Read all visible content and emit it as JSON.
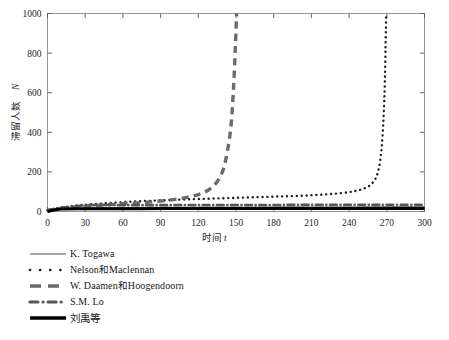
{
  "chart_data": {
    "type": "line",
    "title": "",
    "xlabel": "时间 t",
    "ylabel": "滞留人数 N",
    "xlabel_cjk": "时间",
    "xlabel_var": "t",
    "ylabel_cjk": "滞留人数",
    "ylabel_var": "N",
    "xlim": [
      0,
      300
    ],
    "ylim": [
      0,
      1000
    ],
    "xticks": [
      0,
      30,
      60,
      90,
      120,
      150,
      180,
      210,
      240,
      270,
      300
    ],
    "yticks": [
      0,
      200,
      400,
      600,
      800,
      1000
    ],
    "grid": false,
    "legend_position": "below-left",
    "series": [
      {
        "name": "K. Togawa",
        "style": "solid-thin",
        "color": "#4a4a4a",
        "width": 1.0,
        "x": [
          0,
          15,
          30,
          60,
          90,
          120,
          150,
          180,
          210,
          240,
          270,
          300
        ],
        "values": [
          0,
          14,
          18,
          20,
          21,
          22,
          22,
          23,
          23,
          23,
          24,
          24
        ]
      },
      {
        "name": "Nelson和Maclennan",
        "name_latin_1": "Nelson",
        "name_han": "和",
        "name_latin_2": "Maclennan",
        "style": "dotted",
        "color": "#1f1f1f",
        "width": 2.4,
        "x": [
          0,
          10,
          20,
          30,
          45,
          60,
          75,
          90,
          105,
          120,
          135,
          150,
          165,
          180,
          195,
          210,
          225,
          240,
          250,
          258,
          263,
          266,
          268,
          269,
          269.5
        ],
        "values": [
          6,
          20,
          28,
          34,
          41,
          47,
          52,
          56,
          60,
          63,
          66,
          69,
          72,
          75,
          78,
          82,
          88,
          98,
          112,
          140,
          200,
          330,
          560,
          830,
          1000
        ]
      },
      {
        "name": "W. Daamen和Hoogendoorn",
        "name_latin_1": "W. Daamen",
        "name_han": "和",
        "name_latin_2": "Hoogendoorn",
        "style": "dashed-thick",
        "color": "#6b6b6b",
        "width": 3.4,
        "x": [
          0,
          10,
          20,
          30,
          45,
          60,
          75,
          90,
          100,
          110,
          118,
          125,
          131,
          136,
          140,
          143,
          146,
          148,
          149.5,
          150.5
        ],
        "values": [
          4,
          15,
          22,
          27,
          33,
          39,
          45,
          53,
          60,
          70,
          82,
          98,
          122,
          160,
          215,
          300,
          430,
          620,
          830,
          1000
        ]
      },
      {
        "name": "S.M. Lo",
        "style": "dash-dot",
        "color": "#555555",
        "width": 2.6,
        "x": [
          0,
          30,
          60,
          90,
          120,
          150,
          180,
          210,
          240,
          270,
          300
        ],
        "values": [
          8,
          31,
          32,
          32,
          33,
          33,
          33,
          34,
          34,
          34,
          34
        ]
      },
      {
        "name": "刘禹等",
        "style": "solid-thick",
        "color": "#000000",
        "width": 3.0,
        "x": [
          0,
          10,
          30,
          60,
          90,
          120,
          150,
          180,
          210,
          240,
          270,
          300
        ],
        "values": [
          0,
          12,
          14,
          14,
          15,
          15,
          15,
          15,
          15,
          15,
          15,
          15
        ]
      }
    ]
  },
  "legend": {
    "items": [
      {
        "key": "solid-thin",
        "label": "K. Togawa"
      },
      {
        "key": "dotted",
        "label": "Nelson和Maclennan"
      },
      {
        "key": "dashed-thick",
        "label": "W. Daamen和Hoogendoorn"
      },
      {
        "key": "dash-dot",
        "label": "S.M. Lo"
      },
      {
        "key": "solid-thick",
        "label": "刘禹等"
      }
    ]
  },
  "colors": {
    "frame": "#8a8a8a",
    "text": "#1d1d1d",
    "background": "#ffffff",
    "dashed_gray": "#6b6b6b",
    "black": "#000000"
  }
}
